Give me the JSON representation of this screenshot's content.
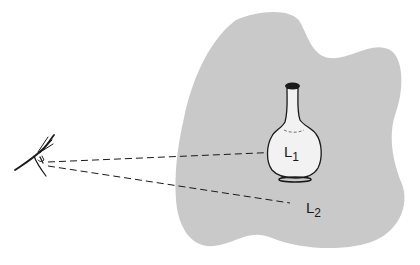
{
  "diagram": {
    "colors": {
      "background": "#ffffff",
      "surface": "#c9c9c9",
      "flask_fill": "#f2f2f2",
      "ink": "#1a1a1a"
    },
    "elements": {
      "eye": {
        "icon": "eye-icon"
      },
      "flask": {
        "icon": "flask-icon"
      },
      "background_surface": {
        "shape": "irregular-blob"
      }
    },
    "labels": {
      "l1": {
        "base": "L",
        "sub": "1"
      },
      "l2": {
        "base": "L",
        "sub": "2"
      }
    },
    "sight_lines": [
      {
        "from": "eye",
        "to": "L1",
        "style": "dashed"
      },
      {
        "from": "eye",
        "to": "L2",
        "style": "dashed"
      }
    ]
  }
}
